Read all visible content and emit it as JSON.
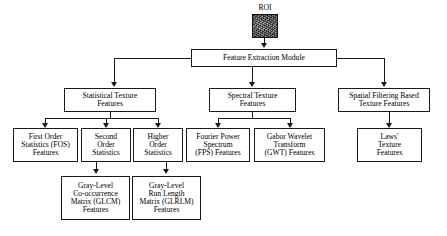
{
  "diagram": {
    "title": "Feature Extraction Module",
    "roi": {
      "label": "ROI",
      "image_alt": "roi-texture-thumbnail"
    },
    "root": {
      "label": "Feature Extraction Module"
    },
    "level2": [
      {
        "id": "statistical",
        "label": "Statistical Texture\nFeatures"
      },
      {
        "id": "spectral",
        "label": "Spectral Texture\nFeatures"
      },
      {
        "id": "spatial",
        "label": "Spatial Filtering Based\nTexture Features"
      }
    ],
    "level3": [
      {
        "id": "fos",
        "label": "First Order\nStatistics (FOS)\nFeatures",
        "parent": "statistical"
      },
      {
        "id": "second-order",
        "label": "Second\nOrder\nStatistics",
        "parent": "statistical"
      },
      {
        "id": "higher-order",
        "label": "Higher\nOrder\nStatistics",
        "parent": "statistical"
      },
      {
        "id": "fps",
        "label": "Fourier Power\nSpectrum\n(FPS) Features",
        "parent": "spectral"
      },
      {
        "id": "gwt",
        "label": "Gabor Wavelet\nTransform\n(GWT) Features",
        "parent": "spectral"
      },
      {
        "id": "laws",
        "label": "Laws'\nTexture\nFeatures",
        "parent": "spatial"
      }
    ],
    "level4": [
      {
        "id": "glcm",
        "label": "Gray-Level\nCo-occurrence\nMatrix (GLCM)\nFeatures",
        "parent": "second-order"
      },
      {
        "id": "glrlm",
        "label": "Gray-Level\nRun Length\nMatrix (GLRLM)\nFeatures",
        "parent": "higher-order"
      }
    ],
    "colors": {
      "stroke": "#1a1a1a",
      "box_fill": "#ffffff",
      "text": "#000000",
      "roi_image": "#4a4a4a"
    }
  }
}
